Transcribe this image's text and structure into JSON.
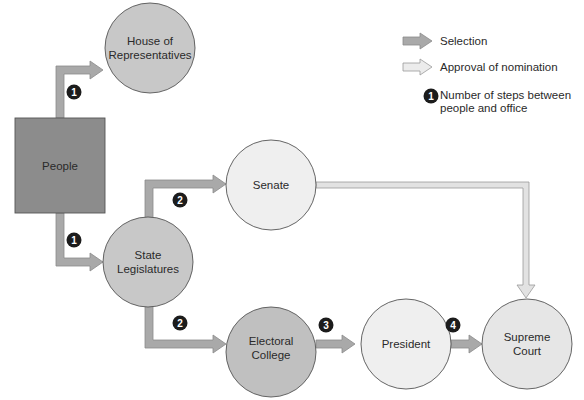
{
  "nodes": {
    "house": {
      "label_line1": "House of",
      "label_line2": "Representatives"
    },
    "people": {
      "label": "People"
    },
    "senate": {
      "label": "Senate"
    },
    "state_legislatures": {
      "label_line1": "State",
      "label_line2": "Legislatures"
    },
    "electoral_college": {
      "label_line1": "Electoral",
      "label_line2": "College"
    },
    "president": {
      "label": "President"
    },
    "supreme_court": {
      "label_line1": "Supreme",
      "label_line2": "Court"
    }
  },
  "steps": {
    "people_to_house": "1",
    "people_to_state": "1",
    "state_to_senate": "2",
    "state_to_electoral": "2",
    "electoral_to_president": "3",
    "president_to_court": "4"
  },
  "legend": {
    "selection": "Selection",
    "approval": "Approval of nomination",
    "steps_badge": "1",
    "steps_line1": "Number of steps between",
    "steps_line2": "people and office"
  },
  "colors": {
    "dark_fill": "#8c8c8c",
    "medium_fill": "#c8c8c8",
    "light_fill": "#efefef",
    "selection_arrow": "#a9a9a9",
    "approval_arrow": "#e2e2e2",
    "badge": "#1c1c1c"
  }
}
